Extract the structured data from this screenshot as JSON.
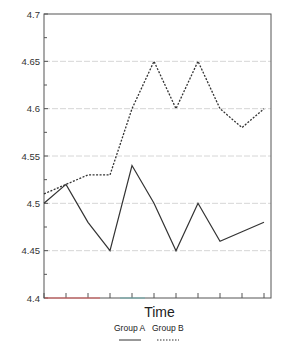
{
  "chart_data": {
    "type": "line",
    "title": "",
    "xlabel": "Time",
    "ylabel": "",
    "x": [
      0,
      1,
      2,
      3,
      4,
      5,
      6,
      7,
      8,
      9,
      10
    ],
    "xtick_labels": [],
    "ylim": [
      4.4,
      4.7
    ],
    "yticks": [
      4.4,
      4.45,
      4.5,
      4.55,
      4.6,
      4.65,
      4.7
    ],
    "ytick_labels": [
      "4.4",
      "4.45",
      "4.5",
      "4.55",
      "4.6",
      "4.65",
      "4.7"
    ],
    "grid": "horizontal",
    "legend_position": "bottom",
    "series": [
      {
        "name": "Group A",
        "style": "solid",
        "color": "#333333",
        "values": [
          4.5,
          4.52,
          4.48,
          4.45,
          4.54,
          4.5,
          4.45,
          4.5,
          4.46,
          4.47,
          4.48
        ]
      },
      {
        "name": "Group B",
        "style": "dotted",
        "color": "#333333",
        "values": [
          4.51,
          4.52,
          4.53,
          4.53,
          4.6,
          4.65,
          4.6,
          4.65,
          4.6,
          4.58,
          4.6
        ]
      }
    ]
  },
  "colors": {
    "axis": "#555555",
    "grid": "#cccccc",
    "axis_accent_red": "#e06060",
    "axis_accent_teal": "#70b0b0"
  }
}
